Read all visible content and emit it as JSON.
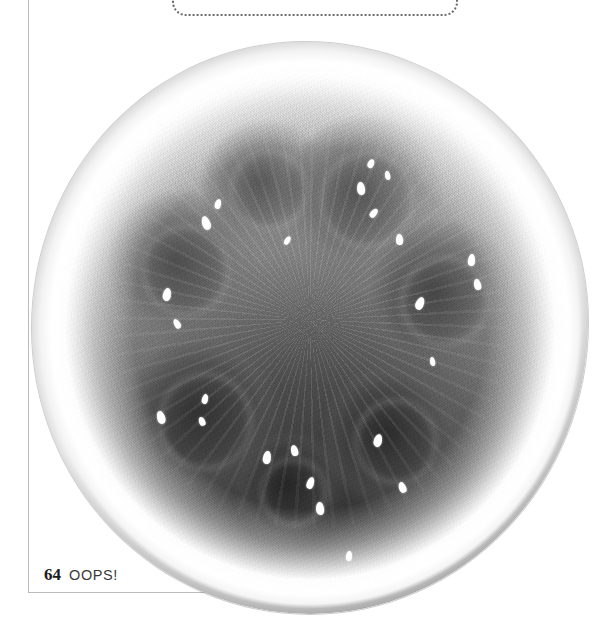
{
  "page": {
    "folio": "64",
    "section_title": "OOPS!",
    "background_color": "#ffffff",
    "rule_color": "#b9bcbe"
  },
  "callout": {
    "name": "dotted-callout-box",
    "style": "dotted",
    "border_color": "#6a6a6a",
    "visible_portion": "bottom-edge-only"
  },
  "photo": {
    "subject": "watermelon cross-section",
    "treatment": "black-and-white photograph",
    "rind_color": "#ffffff",
    "flesh_color_dark": "#1e1e1e",
    "flesh_color_light": "#c8c8c6",
    "skin_outline_color": "#2a2a2a",
    "seed_color": "#ffffff",
    "lobes": [
      {
        "cx": 24,
        "cy": 38,
        "r": 15
      },
      {
        "cx": 41,
        "cy": 22,
        "r": 13
      },
      {
        "cx": 61,
        "cy": 24,
        "r": 16
      },
      {
        "cx": 77,
        "cy": 44,
        "r": 15
      },
      {
        "cx": 67,
        "cy": 72,
        "r": 14
      },
      {
        "cx": 28,
        "cy": 68,
        "r": 16
      },
      {
        "cx": 46,
        "cy": 82,
        "r": 11
      }
    ],
    "seeds": [
      {
        "x": 30.5,
        "y": 30.5,
        "w": 1.5,
        "h": 2.4,
        "rot": -20
      },
      {
        "x": 33.0,
        "y": 27.5,
        "w": 1.1,
        "h": 1.8,
        "rot": 15
      },
      {
        "x": 23.5,
        "y": 43.0,
        "w": 1.4,
        "h": 2.2,
        "rot": 10
      },
      {
        "x": 25.5,
        "y": 48.5,
        "w": 1.0,
        "h": 1.7,
        "rot": -30
      },
      {
        "x": 58.5,
        "y": 24.5,
        "w": 1.4,
        "h": 2.3,
        "rot": -8
      },
      {
        "x": 60.5,
        "y": 20.5,
        "w": 1.0,
        "h": 1.6,
        "rot": 25
      },
      {
        "x": 63.5,
        "y": 22.5,
        "w": 0.9,
        "h": 1.5,
        "rot": -12
      },
      {
        "x": 61.0,
        "y": 29.0,
        "w": 1.0,
        "h": 1.7,
        "rot": 40
      },
      {
        "x": 65.5,
        "y": 33.5,
        "w": 1.2,
        "h": 1.9,
        "rot": -5
      },
      {
        "x": 78.5,
        "y": 37.0,
        "w": 1.3,
        "h": 2.1,
        "rot": 5
      },
      {
        "x": 79.5,
        "y": 41.5,
        "w": 1.2,
        "h": 2.0,
        "rot": -14
      },
      {
        "x": 69.0,
        "y": 44.5,
        "w": 1.5,
        "h": 2.2,
        "rot": 22
      },
      {
        "x": 22.5,
        "y": 64.5,
        "w": 1.4,
        "h": 2.3,
        "rot": -18
      },
      {
        "x": 30.5,
        "y": 61.5,
        "w": 1.1,
        "h": 1.8,
        "rot": 12
      },
      {
        "x": 30.0,
        "y": 65.5,
        "w": 1.0,
        "h": 1.6,
        "rot": -25
      },
      {
        "x": 41.5,
        "y": 71.5,
        "w": 1.4,
        "h": 2.2,
        "rot": 8
      },
      {
        "x": 46.5,
        "y": 70.5,
        "w": 1.3,
        "h": 2.0,
        "rot": -16
      },
      {
        "x": 49.5,
        "y": 76.0,
        "w": 1.3,
        "h": 2.1,
        "rot": 18
      },
      {
        "x": 51.0,
        "y": 80.5,
        "w": 1.4,
        "h": 2.2,
        "rot": -6
      },
      {
        "x": 61.5,
        "y": 68.5,
        "w": 1.4,
        "h": 2.2,
        "rot": 14
      },
      {
        "x": 66.0,
        "y": 77.0,
        "w": 1.2,
        "h": 2.0,
        "rot": -22
      },
      {
        "x": 56.5,
        "y": 89.0,
        "w": 1.1,
        "h": 1.8,
        "rot": 6
      },
      {
        "x": 45.5,
        "y": 34.0,
        "w": 0.9,
        "h": 1.5,
        "rot": 30
      },
      {
        "x": 71.5,
        "y": 55.0,
        "w": 0.9,
        "h": 1.6,
        "rot": -10
      }
    ]
  }
}
